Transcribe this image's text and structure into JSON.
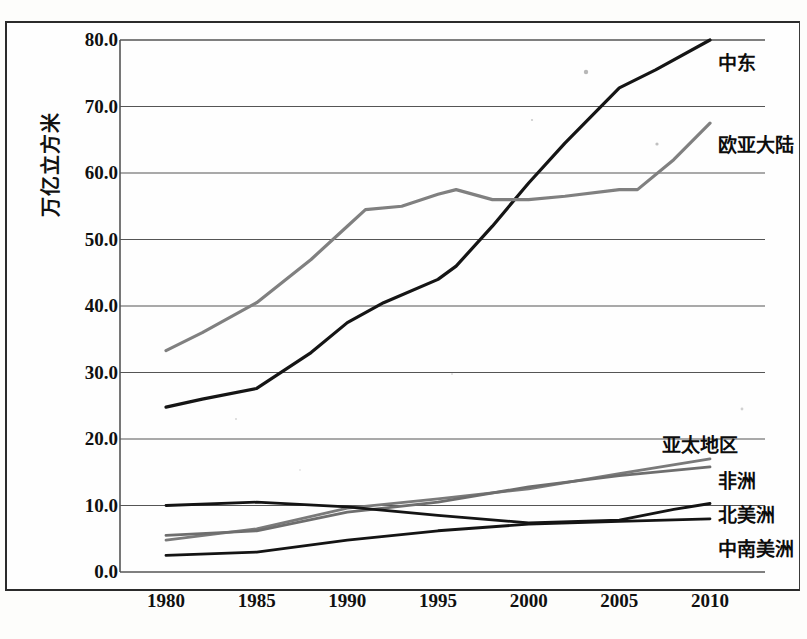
{
  "chart_data": {
    "type": "line",
    "title": "",
    "subtitle": "",
    "xlabel": "",
    "ylabel": "万亿立方米",
    "x": [
      1980,
      1985,
      1990,
      1995,
      2000,
      2005,
      2010
    ],
    "xlim": [
      1980,
      2010
    ],
    "ylim": [
      0,
      80
    ],
    "yticks": [
      "0.0",
      "10.0",
      "20.0",
      "30.0",
      "40.0",
      "50.0",
      "60.0",
      "70.0",
      "80.0"
    ],
    "ytick_values": [
      0,
      10,
      20,
      30,
      40,
      50,
      60,
      70,
      80
    ],
    "xticks": [
      "1980",
      "1985",
      "1990",
      "1995",
      "2000",
      "2005",
      "2010"
    ],
    "grid": "horizontal",
    "legend_position": "inline-right",
    "series": [
      {
        "name": "中东",
        "label": "中东",
        "color": "#151515",
        "width": 3.2,
        "label_y": 48,
        "x": [
          1980,
          1982,
          1985,
          1988,
          1990,
          1992,
          1995,
          1996,
          1998,
          2000,
          2002,
          2005,
          2007,
          2010
        ],
        "values": [
          24.8,
          26.0,
          27.6,
          33.0,
          37.5,
          40.5,
          44.0,
          46.0,
          52.0,
          58.5,
          64.5,
          72.8,
          75.5,
          80.0
        ]
      },
      {
        "name": "欧亚大陆",
        "label": "欧亚大陆",
        "color": "#808080",
        "width": 3.2,
        "label_y": 130,
        "x": [
          1980,
          1982,
          1985,
          1988,
          1990,
          1991,
          1993,
          1995,
          1996,
          1998,
          2000,
          2002,
          2005,
          2006,
          2008,
          2010
        ],
        "values": [
          33.3,
          36.0,
          40.5,
          47.0,
          52.0,
          54.5,
          55.0,
          56.8,
          57.5,
          56.0,
          56.0,
          56.5,
          57.5,
          57.5,
          62.0,
          67.5
        ]
      },
      {
        "name": "亚太地区",
        "label": "亚太地区",
        "color": "#7a7a7a",
        "width": 2.8,
        "label_y": 430,
        "x": [
          1980,
          1985,
          1990,
          1995,
          2000,
          2005,
          2010
        ],
        "values": [
          4.8,
          6.5,
          9.6,
          11.0,
          12.5,
          14.8,
          17.0
        ]
      },
      {
        "name": "非洲",
        "label": "非洲",
        "color": "#6e6e6e",
        "width": 2.8,
        "label_y": 466,
        "x": [
          1980,
          1985,
          1990,
          1995,
          2000,
          2005,
          2010
        ],
        "values": [
          5.5,
          6.2,
          9.0,
          10.5,
          12.8,
          14.5,
          15.8
        ]
      },
      {
        "name": "北美洲",
        "label": "北美洲",
        "color": "#141414",
        "width": 2.8,
        "label_y": 500,
        "x": [
          1980,
          1985,
          1990,
          1995,
          2000,
          2005,
          2008,
          2010
        ],
        "values": [
          10.0,
          10.5,
          9.8,
          8.5,
          7.4,
          7.8,
          9.4,
          10.3
        ]
      },
      {
        "name": "中南美洲",
        "label": "中南美洲",
        "color": "#141414",
        "width": 2.8,
        "label_y": 534,
        "x": [
          1980,
          1985,
          1990,
          1995,
          2000,
          2005,
          2010
        ],
        "values": [
          2.5,
          3.0,
          4.8,
          6.2,
          7.2,
          7.6,
          8.0
        ]
      }
    ],
    "annotations": []
  },
  "axis": {
    "y_title": "万亿立方米"
  }
}
